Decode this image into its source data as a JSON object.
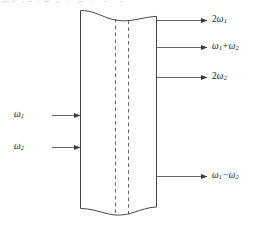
{
  "figure": {
    "name": "nonlinear-optical-crystal-wave-mixing-diagram",
    "colors": {
      "stroke": "#3d3d3d",
      "arrow": "#4a4a4a",
      "dashed": "#555555",
      "text": "#1a1a1a",
      "background": "#ffffff"
    },
    "medium": {
      "left_edge_x": 80,
      "right_edge_x": 157,
      "top_y": 10,
      "bottom_y": 212,
      "dashed_lines_x": [
        115,
        128
      ]
    }
  },
  "inputs": [
    {
      "id": "input-omega-1",
      "symbol": "ω",
      "subscript": "1",
      "text": "ω₁",
      "y": 115,
      "arrow_start_x": 52,
      "arrow_end_x": 80,
      "label_x": 14
    },
    {
      "id": "input-omega-2",
      "symbol": "ω",
      "subscript": "2",
      "text": "ω₂",
      "y": 147,
      "arrow_start_x": 52,
      "arrow_end_x": 80,
      "label_x": 14
    }
  ],
  "outputs": [
    {
      "id": "output-2-omega-1",
      "coefficient": "2",
      "symbol": "ω",
      "subscript": "1",
      "text": "2ω₁",
      "y": 20,
      "arrow_start_x": 157,
      "arrow_end_x": 207,
      "label_x": 212
    },
    {
      "id": "output-omega-1-plus-omega-2",
      "symbol": "ω",
      "subscript": "1",
      "operator": "+",
      "symbol2": "ω",
      "subscript2": "2",
      "text": "ω₁ + ω₂",
      "y": 47,
      "arrow_start_x": 157,
      "arrow_end_x": 207,
      "label_x": 212
    },
    {
      "id": "output-2-omega-2",
      "coefficient": "2",
      "symbol": "ω",
      "subscript": "2",
      "text": "2ω₂",
      "y": 77,
      "arrow_start_x": 157,
      "arrow_end_x": 207,
      "label_x": 212
    },
    {
      "id": "output-omega-1-minus-omega-2",
      "symbol": "ω",
      "subscript": "1",
      "operator": "−",
      "symbol2": "ω",
      "subscript2": "2",
      "text": "ω₁ − ω₂",
      "y": 176,
      "arrow_start_x": 157,
      "arrow_end_x": 207,
      "label_x": 212
    }
  ]
}
